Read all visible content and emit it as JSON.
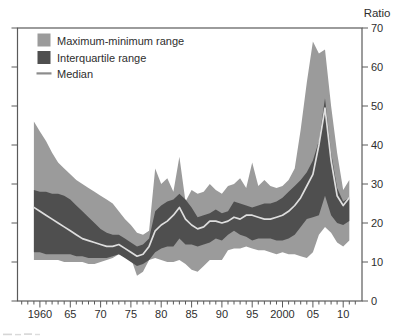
{
  "figure": {
    "right_axis_title": "Ratio"
  },
  "chart_data": {
    "type": "area",
    "subtype": "fan-band-chart",
    "title": "",
    "right_axis_title": "Ratio",
    "grid": false,
    "legend_position": "top-left-inside",
    "axis_color": "#5a5a5a",
    "text_color": "#2e2e2e",
    "background_color": "#ffffff",
    "ylim": [
      0,
      70
    ],
    "yticks": [
      0,
      10,
      20,
      30,
      40,
      50,
      60,
      70
    ],
    "xlim": [
      1956.3,
      2013.1
    ],
    "xticks": [
      1960,
      1965,
      1970,
      1975,
      1980,
      1985,
      1990,
      1995,
      2000,
      2005,
      2010
    ],
    "xtick_labels": [
      "1960",
      "65",
      "70",
      "75",
      "80",
      "85",
      "90",
      "95",
      "2000",
      "05",
      "10"
    ],
    "minor_xticks_every_year": true,
    "x": [
      1959,
      1960,
      1961,
      1962,
      1963,
      1964,
      1965,
      1966,
      1967,
      1968,
      1969,
      1970,
      1971,
      1972,
      1973,
      1974,
      1975,
      1976,
      1977,
      1978,
      1979,
      1980,
      1981,
      1982,
      1983,
      1984,
      1985,
      1986,
      1987,
      1988,
      1989,
      1990,
      1991,
      1992,
      1993,
      1994,
      1995,
      1996,
      1997,
      1998,
      1999,
      2000,
      2001,
      2002,
      2003,
      2004,
      2005,
      2006,
      2007,
      2008,
      2009,
      2010,
      2011
    ],
    "series": [
      {
        "name": "Maximum-minimum range",
        "type": "band",
        "color": "#9b9b9b",
        "upper": [
          46,
          43.5,
          41,
          38,
          35.5,
          34,
          32.5,
          31,
          30,
          29,
          28,
          27,
          26,
          25,
          23,
          21,
          19.5,
          17.5,
          17,
          18,
          34,
          30,
          31.5,
          28,
          37,
          25.5,
          28.5,
          27.5,
          28,
          30,
          28.5,
          27.5,
          29.5,
          30,
          31.5,
          29,
          35.5,
          29.5,
          31,
          29.5,
          29,
          29.5,
          31,
          34,
          44,
          56,
          66.5,
          63.5,
          64.5,
          50,
          38,
          28.5,
          31
        ],
        "lower": [
          10.5,
          10.5,
          10.5,
          10.5,
          10.5,
          10,
          10,
          10,
          10,
          9.5,
          9.5,
          10,
          10.5,
          11,
          12,
          11.5,
          11,
          6.5,
          7.5,
          10.5,
          11,
          10.5,
          10,
          10,
          10.5,
          9.5,
          8,
          7.5,
          9,
          10.5,
          10.5,
          10.5,
          13,
          13.5,
          13.5,
          14,
          13.5,
          13,
          13,
          12.5,
          12,
          12.5,
          12,
          12,
          11.5,
          11,
          12.5,
          17,
          19,
          17.5,
          15,
          14,
          15.5
        ]
      },
      {
        "name": "Interquartile range",
        "type": "band",
        "color": "#4f4f4f",
        "upper": [
          28.5,
          28,
          28,
          27.5,
          27.5,
          27,
          26,
          24.5,
          23,
          21.5,
          20,
          18.5,
          17.5,
          17,
          17,
          16,
          15,
          14,
          14.5,
          16,
          23,
          24.5,
          25.5,
          26,
          27.5,
          26,
          24,
          21.5,
          22,
          22.5,
          23.5,
          22.5,
          23,
          25.5,
          25,
          24.5,
          24,
          24.5,
          25,
          25,
          25.5,
          26.5,
          28,
          29.5,
          31,
          33,
          36,
          41,
          52,
          38,
          29,
          25.5,
          26.5
        ],
        "lower": [
          12.5,
          12.5,
          12,
          12,
          12,
          12,
          12,
          11.5,
          11.5,
          11,
          11,
          11,
          11,
          11.5,
          12,
          11,
          10,
          9,
          9.5,
          10.5,
          12.5,
          13.5,
          14,
          14,
          16,
          14.5,
          14.5,
          14,
          14.5,
          15,
          16,
          15.5,
          17,
          18,
          17,
          16.5,
          15.5,
          16,
          16,
          16,
          15.5,
          15.5,
          16,
          17,
          19,
          21,
          21.5,
          22,
          27,
          22,
          20,
          19.5,
          20.5
        ]
      },
      {
        "name": "Median",
        "type": "line",
        "color": "#dedede",
        "legend_color": "#8c8c8c",
        "values": [
          24,
          23,
          22,
          21,
          20,
          19,
          18,
          17,
          16,
          15.5,
          15,
          14.5,
          14,
          14,
          14.5,
          13.5,
          12.5,
          11.5,
          12,
          14,
          18,
          19.5,
          20.5,
          22,
          24,
          21,
          19.5,
          18.5,
          19,
          20.5,
          20.5,
          20,
          20.5,
          21.5,
          21,
          22,
          22,
          21.5,
          21,
          21,
          21.5,
          22,
          23,
          24.5,
          26.5,
          29.5,
          32.5,
          40,
          49.5,
          36,
          27,
          24.5,
          26.5
        ]
      }
    ]
  }
}
